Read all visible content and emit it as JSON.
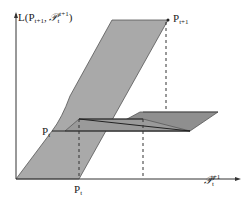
{
  "diagram": {
    "y_axis_label": "L(P",
    "y_axis_label_sub1": "t+1",
    "y_axis_label_sep": ", ",
    "y_axis_label_script": "𝒫",
    "y_axis_label_sub2": "t",
    "y_axis_label_sup2": "t+1",
    "y_axis_label_close": ")",
    "x_axis_label_script": "𝒫",
    "x_axis_label_sub": "t",
    "x_axis_label_sup": "t+1",
    "point_top_label": "P",
    "point_top_sub": "t+1",
    "point_left_label": "P",
    "point_left_sub": "t",
    "point_bottom_label": "P",
    "point_bottom_sub": "t",
    "colors": {
      "surface_light": "#a8a8a8",
      "surface_dark": "#8e8e8e",
      "axis": "#333333",
      "line": "#222222"
    }
  }
}
